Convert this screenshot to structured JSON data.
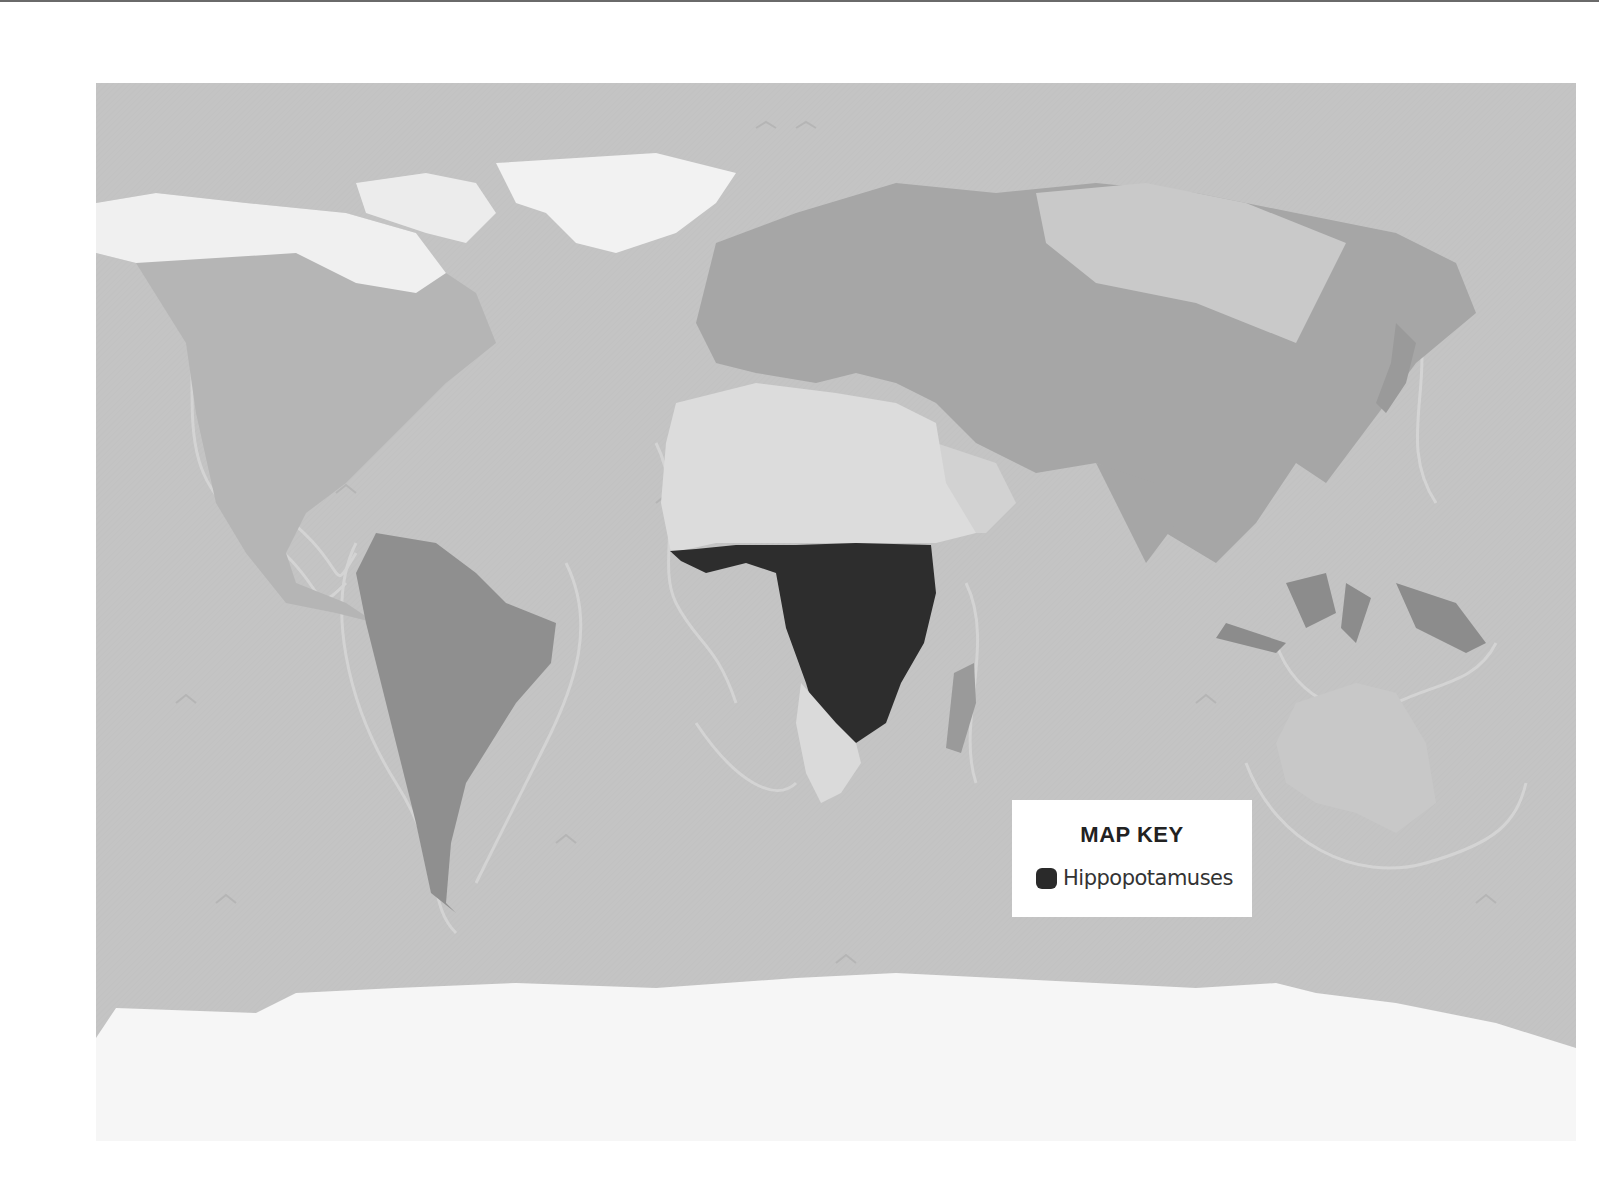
{
  "map": {
    "title": "World map of hippopotamus range",
    "projection": "world",
    "colors": {
      "ocean": "#c4c4c4",
      "land": "#b2b2b2",
      "land_dark": "#9c9c9c",
      "ice": "#f4f4f4",
      "highlight": "#2a2a2a"
    },
    "highlighted_region": "Sub-Saharan Africa"
  },
  "legend": {
    "title": "MAP KEY",
    "items": [
      {
        "label": "Hippopotamuses",
        "color": "#2a2a2a",
        "icon": "rounded-square-swatch"
      }
    ]
  }
}
